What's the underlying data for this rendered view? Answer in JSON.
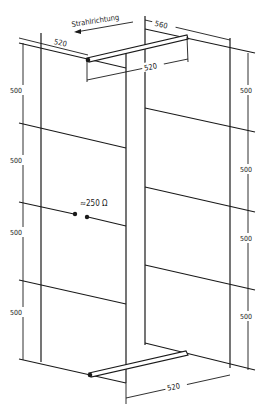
{
  "labels": {
    "beam_direction": "Strahlrichtung",
    "top_width_left": "520",
    "top_width_right": "520",
    "depth": "560",
    "bottom_width": "520",
    "impedance": "≈250 Ω"
  },
  "left_dimensions": [
    "500",
    "500",
    "500",
    "500"
  ],
  "right_dimensions": [
    "500",
    "500",
    "500",
    "500"
  ],
  "units_implied": "mm"
}
